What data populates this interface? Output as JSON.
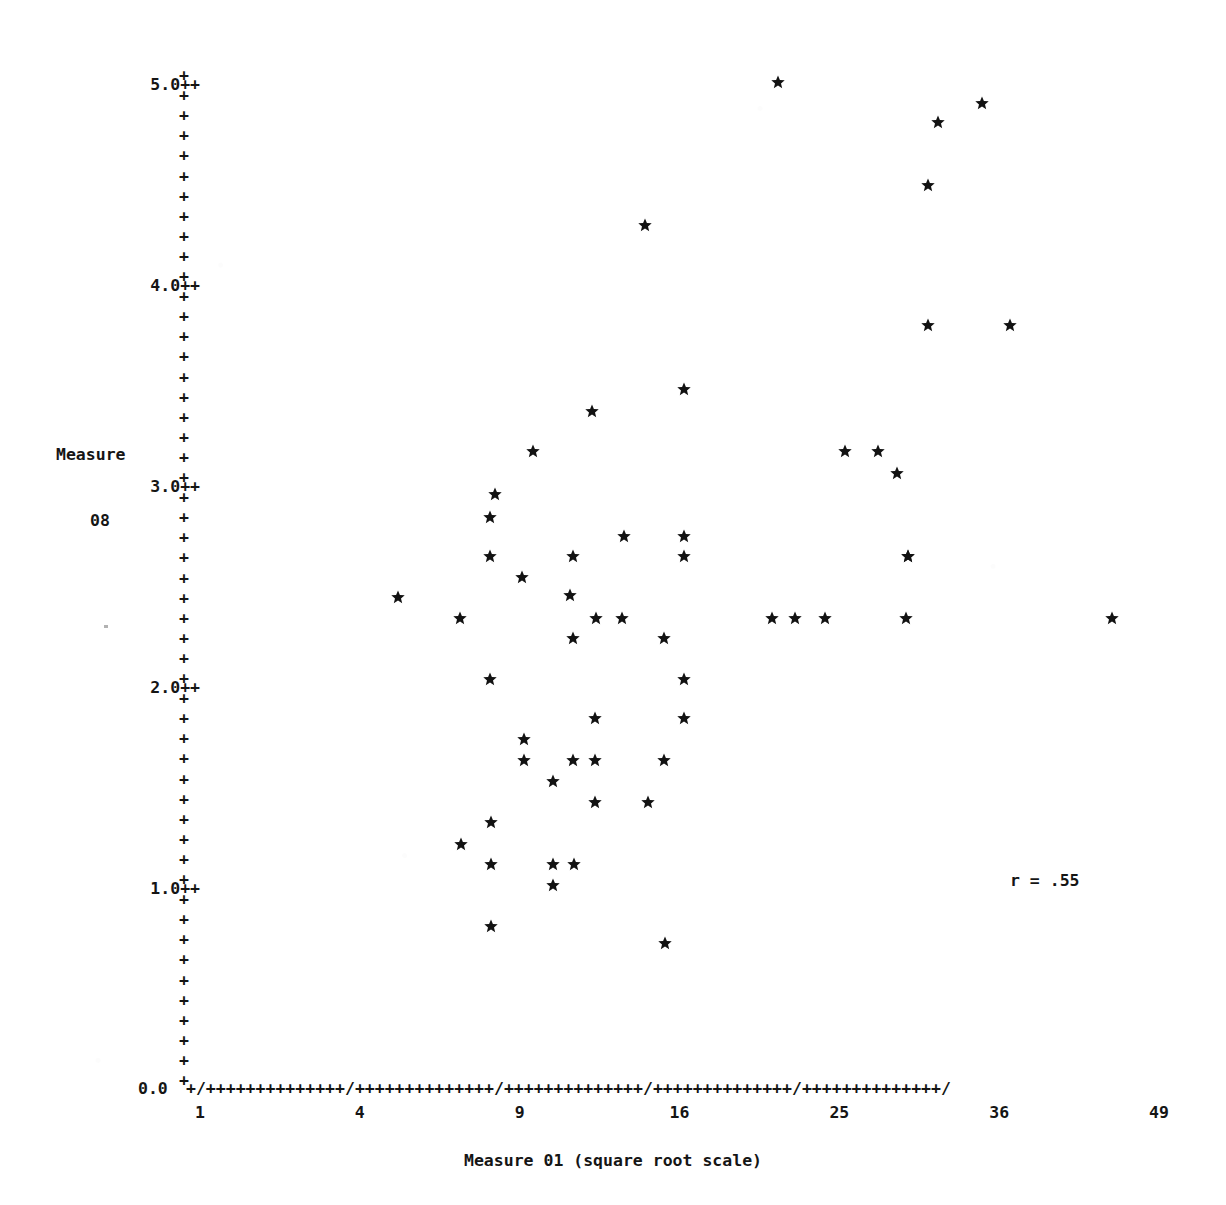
{
  "chart_data": {
    "type": "scatter",
    "title": "",
    "xlabel": "Measure 01 (square root scale)",
    "ylabel": "Measure 08",
    "ylabel_line1": "Measure",
    "ylabel_line2": "08",
    "annotation": "r = .55",
    "correlation": 0.55,
    "x_scale": "square root",
    "x_tick_labels": [
      "1",
      "4",
      "9",
      "16",
      "25",
      "36",
      "49"
    ],
    "x_tick_values": [
      1,
      4,
      9,
      16,
      25,
      36,
      49
    ],
    "xlim": [
      1,
      49
    ],
    "y_tick_labels": [
      "0.0",
      "1.0",
      "2.0",
      "3.0",
      "4.0",
      "5.0"
    ],
    "y_tick_values": [
      0.0,
      1.0,
      2.0,
      3.0,
      4.0,
      5.0
    ],
    "ylim": [
      0.0,
      5.0
    ],
    "y_minor_ticks_per_major": 10,
    "grid": false,
    "legend": false,
    "axis_style": "ascii-plus-characters",
    "marker": "star",
    "n_points": 62,
    "points": [
      {
        "x": 20.2,
        "y": 4.95
      },
      {
        "x": 35.0,
        "y": 4.85
      },
      {
        "x": 31.8,
        "y": 4.76
      },
      {
        "x": 31.0,
        "y": 4.45
      },
      {
        "x": 13.5,
        "y": 4.25
      },
      {
        "x": 31.0,
        "y": 3.76
      },
      {
        "x": 37.2,
        "y": 3.76
      },
      {
        "x": 15.4,
        "y": 3.45
      },
      {
        "x": 12.5,
        "y": 3.34
      },
      {
        "x": 10.4,
        "y": 3.15
      },
      {
        "x": 23.7,
        "y": 3.15
      },
      {
        "x": 24.7,
        "y": 3.15
      },
      {
        "x": 25.6,
        "y": 3.04
      },
      {
        "x": 9.3,
        "y": 3.0
      },
      {
        "x": 8.6,
        "y": 2.8
      },
      {
        "x": 11.9,
        "y": 2.8
      },
      {
        "x": 15.6,
        "y": 2.8
      },
      {
        "x": 28.9,
        "y": 2.8
      },
      {
        "x": 8.6,
        "y": 2.7
      },
      {
        "x": 11.9,
        "y": 2.7
      },
      {
        "x": 15.6,
        "y": 2.7
      },
      {
        "x": 28.9,
        "y": 2.7
      },
      {
        "x": 9.6,
        "y": 2.6
      },
      {
        "x": 5.3,
        "y": 2.45
      },
      {
        "x": 11.5,
        "y": 2.45
      },
      {
        "x": 7.7,
        "y": 2.4
      },
      {
        "x": 11.0,
        "y": 2.4
      },
      {
        "x": 12.6,
        "y": 2.4
      },
      {
        "x": 19.8,
        "y": 2.4
      },
      {
        "x": 20.8,
        "y": 2.4
      },
      {
        "x": 22.0,
        "y": 2.4
      },
      {
        "x": 29.0,
        "y": 2.4
      },
      {
        "x": 44.5,
        "y": 2.4
      },
      {
        "x": 11.9,
        "y": 2.32
      },
      {
        "x": 14.9,
        "y": 2.32
      },
      {
        "x": 8.6,
        "y": 2.15
      },
      {
        "x": 15.6,
        "y": 2.15
      },
      {
        "x": 12.7,
        "y": 1.9
      },
      {
        "x": 15.7,
        "y": 1.9
      },
      {
        "x": 9.8,
        "y": 1.8
      },
      {
        "x": 9.8,
        "y": 1.7
      },
      {
        "x": 11.8,
        "y": 1.7
      },
      {
        "x": 12.7,
        "y": 1.7
      },
      {
        "x": 15.0,
        "y": 1.7
      },
      {
        "x": 10.6,
        "y": 1.6
      },
      {
        "x": 11.9,
        "y": 1.5
      },
      {
        "x": 14.2,
        "y": 1.5
      },
      {
        "x": 8.8,
        "y": 1.4
      },
      {
        "x": 7.9,
        "y": 1.3
      },
      {
        "x": 8.8,
        "y": 1.2
      },
      {
        "x": 11.0,
        "y": 1.2
      },
      {
        "x": 11.6,
        "y": 1.2
      },
      {
        "x": 11.1,
        "y": 1.1
      },
      {
        "x": 8.8,
        "y": 0.9
      },
      {
        "x": 15.3,
        "y": 0.82
      }
    ],
    "pixel_points": [
      {
        "px": 778,
        "py": 82
      },
      {
        "px": 982,
        "py": 103
      },
      {
        "px": 938,
        "py": 122
      },
      {
        "px": 928,
        "py": 185
      },
      {
        "px": 645,
        "py": 225
      },
      {
        "px": 928,
        "py": 325
      },
      {
        "px": 1010,
        "py": 325
      },
      {
        "px": 684,
        "py": 389
      },
      {
        "px": 592,
        "py": 411
      },
      {
        "px": 533,
        "py": 451
      },
      {
        "px": 845,
        "py": 451
      },
      {
        "px": 878,
        "py": 451
      },
      {
        "px": 897,
        "py": 473
      },
      {
        "px": 495,
        "py": 494
      },
      {
        "px": 490,
        "py": 517
      },
      {
        "px": 624,
        "py": 536
      },
      {
        "px": 684,
        "py": 536
      },
      {
        "px": 908,
        "py": 556
      },
      {
        "px": 490,
        "py": 556
      },
      {
        "px": 573,
        "py": 556
      },
      {
        "px": 684,
        "py": 556
      },
      {
        "px": 908,
        "py": 556
      },
      {
        "px": 522,
        "py": 577
      },
      {
        "px": 398,
        "py": 597
      },
      {
        "px": 570,
        "py": 595
      },
      {
        "px": 460,
        "py": 618
      },
      {
        "px": 596,
        "py": 618
      },
      {
        "px": 622,
        "py": 618
      },
      {
        "px": 772,
        "py": 618
      },
      {
        "px": 795,
        "py": 618
      },
      {
        "px": 825,
        "py": 618
      },
      {
        "px": 906,
        "py": 618
      },
      {
        "px": 1112,
        "py": 618
      },
      {
        "px": 573,
        "py": 638
      },
      {
        "px": 664,
        "py": 638
      },
      {
        "px": 490,
        "py": 679
      },
      {
        "px": 684,
        "py": 679
      },
      {
        "px": 595,
        "py": 718
      },
      {
        "px": 684,
        "py": 718
      },
      {
        "px": 524,
        "py": 739
      },
      {
        "px": 524,
        "py": 760
      },
      {
        "px": 573,
        "py": 760
      },
      {
        "px": 595,
        "py": 760
      },
      {
        "px": 664,
        "py": 760
      },
      {
        "px": 553,
        "py": 781
      },
      {
        "px": 595,
        "py": 802
      },
      {
        "px": 648,
        "py": 802
      },
      {
        "px": 491,
        "py": 822
      },
      {
        "px": 461,
        "py": 844
      },
      {
        "px": 491,
        "py": 864
      },
      {
        "px": 553,
        "py": 864
      },
      {
        "px": 574,
        "py": 864
      },
      {
        "px": 553,
        "py": 885
      },
      {
        "px": 491,
        "py": 926
      },
      {
        "px": 665,
        "py": 943
      }
    ]
  },
  "axes": {
    "y_axis_marks": "+",
    "x_axis_major_mark": "/",
    "x_axis_minor_mark": "+",
    "x_axis_string": "+/++++++++++++++/++++++++++++++/++++++++++++++/++++++++++++++/++++++++++++++/",
    "major_suffix": "++",
    "zero_label": "0.0"
  },
  "colors": {
    "ink": "#151515",
    "marker": "#121212",
    "paper": "#ffffff"
  }
}
